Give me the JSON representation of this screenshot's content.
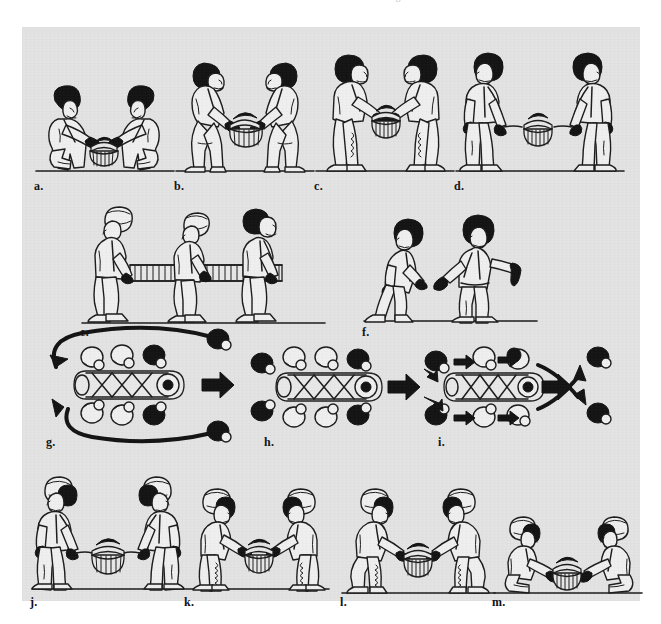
{
  "header": {
    "title": "Patient Handling and Immobilization",
    "page_number": "213",
    "rule_icon": "horizontal-rule-icon"
  },
  "figure": {
    "background_color": "#e3e3e3",
    "page_background_color": "#ffffff",
    "ink_color": "#1a1a1a",
    "rows": [
      {
        "row_index": 1,
        "panel_keys": [
          "a",
          "b",
          "c",
          "d"
        ]
      },
      {
        "row_index": 2,
        "panel_keys": [
          "e",
          "f"
        ]
      },
      {
        "row_index": 3,
        "panel_keys": [
          "g",
          "h",
          "i"
        ]
      },
      {
        "row_index": 4,
        "panel_keys": [
          "j",
          "k",
          "l",
          "m"
        ]
      }
    ],
    "panels": [
      {
        "key": "a",
        "label": "a.",
        "scene": "two-kneeling-rescuers-gripping-basket-litter",
        "figure_count": 2,
        "posture": "kneeling",
        "object": "basket-litter",
        "view": "side"
      },
      {
        "key": "b",
        "label": "b.",
        "scene": "two-rescuers-squatting-lifting-basket-litter",
        "figure_count": 2,
        "posture": "squatting",
        "object": "basket-litter",
        "view": "side"
      },
      {
        "key": "c",
        "label": "c.",
        "scene": "two-rescuers-standing-holding-basket-litter-low",
        "figure_count": 2,
        "posture": "standing-bent",
        "object": "basket-litter",
        "view": "side"
      },
      {
        "key": "d",
        "label": "d.",
        "scene": "two-rescuers-standing-upright-litter-on-straps",
        "figure_count": 2,
        "posture": "standing",
        "object": "basket-litter",
        "view": "side"
      },
      {
        "key": "e",
        "label": "e.",
        "scene": "three-rescuers-walking-carrying-long-litter",
        "figure_count": 3,
        "posture": "walking",
        "object": "long-litter",
        "view": "side"
      },
      {
        "key": "f",
        "label": "f.",
        "scene": "rescuer-walking-and-rescuer-signaling-with-arm-extended",
        "figure_count": 2,
        "posture": "walking-and-signaling",
        "object": "none",
        "view": "side"
      },
      {
        "key": "g",
        "label": "g.",
        "scene": "overhead-litter-with-six-bearers-rear-pair-rotating-forward",
        "figure_count": 8,
        "object": "litter-overhead",
        "view": "overhead",
        "travel_direction": "right",
        "arrows": [
          "rear-left-loop-to-front",
          "rear-right-loop-to-front",
          "travel-direction-arrow"
        ]
      },
      {
        "key": "h",
        "label": "h.",
        "scene": "overhead-litter-with-eight-bearers-in-position",
        "figure_count": 8,
        "object": "litter-overhead",
        "view": "overhead",
        "travel_direction": "right",
        "arrows": [
          "travel-direction-arrow"
        ]
      },
      {
        "key": "i",
        "label": "i.",
        "scene": "overhead-litter-bearers-advancing-front-pair-peeling-off",
        "figure_count": 8,
        "object": "litter-overhead",
        "view": "overhead",
        "travel_direction": "right",
        "arrows": [
          "bearer-advance-arrows",
          "travel-direction-arrow",
          "front-pair-split-arrows"
        ]
      },
      {
        "key": "j",
        "label": "j.",
        "scene": "two-rescuers-standing-upright-litter-suspended-between",
        "figure_count": 2,
        "posture": "standing",
        "object": "basket-litter",
        "view": "side"
      },
      {
        "key": "k",
        "label": "k.",
        "scene": "two-rescuers-bending-lowering-basket-litter",
        "figure_count": 2,
        "posture": "bending",
        "object": "basket-litter",
        "view": "side"
      },
      {
        "key": "l",
        "label": "l.",
        "scene": "two-rescuers-squatting-lowering-basket-litter",
        "figure_count": 2,
        "posture": "squatting",
        "object": "basket-litter",
        "view": "side"
      },
      {
        "key": "m",
        "label": "m.",
        "scene": "two-kneeling-rescuers-setting-basket-litter-on-ground",
        "figure_count": 2,
        "posture": "kneeling",
        "object": "basket-litter",
        "view": "side"
      }
    ]
  }
}
